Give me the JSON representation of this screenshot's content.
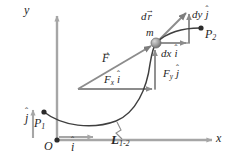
{
  "figure": {
    "background_color": "#ffffff",
    "axis_color": "#a6a6a6",
    "vector_color": "#8c8c8c",
    "curve_color": "#3f3f3f",
    "text_color": "#262626",
    "mass_color": "#9e9e9e",
    "point_color": "#2b2b2b"
  },
  "axes": {
    "x_label": "x",
    "y_label": "y",
    "origin_label": "O"
  },
  "unit_vectors": {
    "i": {
      "base": "i",
      "hat": "ˆ",
      "label": "i-hat"
    },
    "j": {
      "base": "j",
      "hat": "ˆ",
      "label": "j-hat"
    }
  },
  "points": {
    "p1": {
      "base": "P",
      "sub": "1"
    },
    "p2": {
      "base": "P",
      "sub": "2"
    },
    "mass": "m"
  },
  "path": {
    "label_base": "L",
    "label_sub": "1-2"
  },
  "force": {
    "resultant": {
      "base": "F",
      "mark": "→"
    },
    "x_component": {
      "base": "F",
      "sub": "x",
      "unit": "i",
      "hat": "ˆ"
    },
    "y_component": {
      "base": "F",
      "sub": "y",
      "unit": "j",
      "hat": "ˆ"
    }
  },
  "displacement": {
    "resultant": {
      "d": "d",
      "base": "r",
      "mark": "→"
    },
    "x_component": {
      "d": "d",
      "base": "x",
      "unit": "i",
      "hat": "ˆ"
    },
    "y_component": {
      "d": "d",
      "base": "y",
      "unit": "j",
      "hat": "ˆ"
    }
  }
}
